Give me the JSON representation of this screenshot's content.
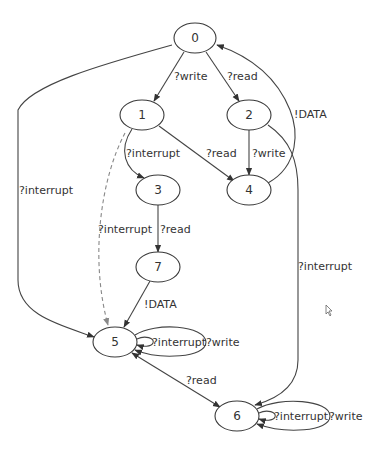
{
  "diagram": {
    "type": "state-machine",
    "nodes": [
      {
        "id": "0",
        "label": "0",
        "cx": 195,
        "cy": 38
      },
      {
        "id": "1",
        "label": "1",
        "cx": 142,
        "cy": 115
      },
      {
        "id": "2",
        "label": "2",
        "cx": 249,
        "cy": 115
      },
      {
        "id": "3",
        "label": "3",
        "cx": 158,
        "cy": 190
      },
      {
        "id": "4",
        "label": "4",
        "cx": 249,
        "cy": 190
      },
      {
        "id": "7",
        "label": "7",
        "cx": 158,
        "cy": 267
      },
      {
        "id": "5",
        "label": "5",
        "cx": 115,
        "cy": 342
      },
      {
        "id": "6",
        "label": "6",
        "cx": 237,
        "cy": 416
      }
    ],
    "edges": [
      {
        "from": "0",
        "to": "1",
        "label": "?write"
      },
      {
        "from": "0",
        "to": "2",
        "label": "?read"
      },
      {
        "from": "4",
        "to": "0",
        "label": "!DATA"
      },
      {
        "from": "0",
        "to": "5",
        "label": "?interrupt"
      },
      {
        "from": "1",
        "to": "3",
        "label": "?interrupt"
      },
      {
        "from": "1",
        "to": "4",
        "label": "?read"
      },
      {
        "from": "1",
        "to": "5",
        "label": "",
        "style": "dashed"
      },
      {
        "from": "2",
        "to": "4",
        "label": "?write"
      },
      {
        "from": "2",
        "to": "6",
        "label": "?interrupt"
      },
      {
        "from": "3",
        "to": "7",
        "label": "?read"
      },
      {
        "from": "3",
        "to": "5",
        "label": "?interrupt"
      },
      {
        "from": "7",
        "to": "5",
        "label": "!DATA"
      },
      {
        "from": "5",
        "to": "5",
        "label": "?interrupt"
      },
      {
        "from": "5",
        "to": "5",
        "label": "?write"
      },
      {
        "from": "5",
        "to": "6",
        "label": "?read",
        "bidirectional": true
      },
      {
        "from": "6",
        "to": "6",
        "label": "?interrupt"
      },
      {
        "from": "6",
        "to": "6",
        "label": "?write"
      }
    ]
  },
  "labels": {
    "n0": "0",
    "n1": "1",
    "n2": "2",
    "n3": "3",
    "n4": "4",
    "n5": "5",
    "n6": "6",
    "n7": "7",
    "e01": "?write",
    "e02": "?read",
    "e40": "!DATA",
    "e05": "?interrupt",
    "e13": "?interrupt",
    "e14": "?read",
    "e24": "?write",
    "e26": "?interrupt",
    "e37": "?read",
    "e35": "?interrupt",
    "e75": "!DATA",
    "e55a": "?interrupt",
    "e55b": "?write",
    "e56": "?read",
    "e66a": "?interrupt",
    "e66b": "?write"
  }
}
